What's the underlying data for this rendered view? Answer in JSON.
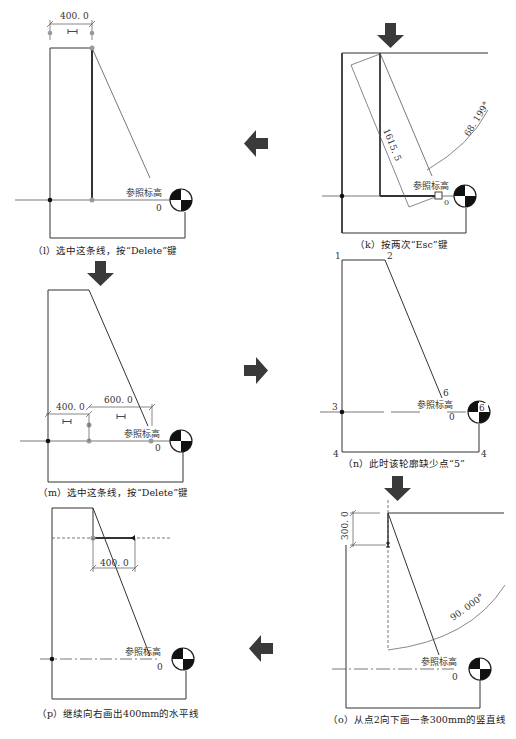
{
  "panels": {
    "l": {
      "caption": "（l）选中这条线，按“Delete”键",
      "dim_width": "400. 0",
      "level_name": "参照标高",
      "level_value": "0"
    },
    "k": {
      "caption": "（k）按两次“Esc”键",
      "dim_length": "1615. 5",
      "angle": "68. 199°",
      "level_name": "参照标高",
      "level_value": "0"
    },
    "m": {
      "caption": "（m）选中这条线，按“Delete”键",
      "dim_left": "400. 0",
      "dim_right": "600. 0",
      "level_name": "参照标高",
      "level_value": "0"
    },
    "n": {
      "caption": "（n）此时该轮廓缺少点“5”",
      "points": [
        "1",
        "2",
        "3",
        "4",
        "4",
        "6",
        "6"
      ],
      "level_name": "参照标高",
      "level_value": "0"
    },
    "p": {
      "caption": "（p）继续向右画出400mm的水平线",
      "dim_width": "400. 0",
      "level_name": "参照标高",
      "level_value": "0"
    },
    "o": {
      "caption": "（o）从点2向下画一条300mm的竖直线",
      "dim_height": "300. 0",
      "angle": "90. 000°",
      "level_name": "参照标高",
      "level_value": "0"
    }
  },
  "flow_arrows": [
    {
      "from": "k",
      "to": "l",
      "direction": "left"
    },
    {
      "from": "l",
      "to": "m",
      "direction": "down"
    },
    {
      "from": "m",
      "to": "n",
      "direction": "right"
    },
    {
      "from": "n",
      "to": "o",
      "direction": "down"
    },
    {
      "from": "o",
      "to": "p",
      "direction": "left"
    },
    {
      "into": "k",
      "direction": "down"
    }
  ],
  "colors": {
    "line": "#333333",
    "arrow": "#3a3a3a",
    "snap_point": "#888888",
    "background": "#ffffff"
  }
}
